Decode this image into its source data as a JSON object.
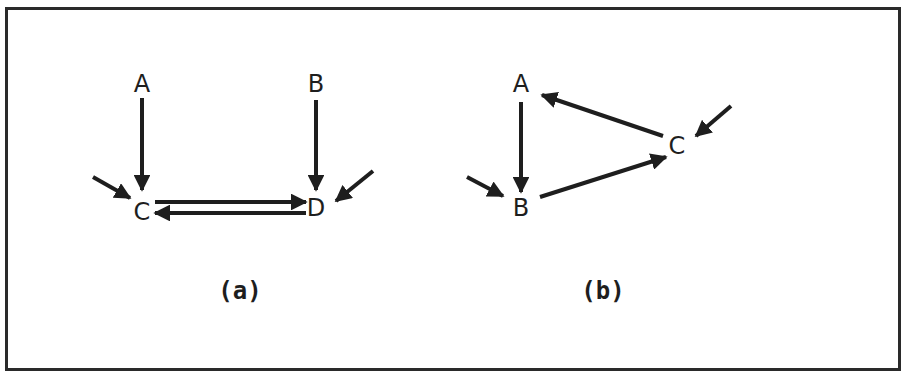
{
  "figures": [
    {
      "id": "a",
      "caption": "(a)",
      "caption_pos": [
        240,
        291
      ],
      "nodes": [
        {
          "id": "A",
          "label": "A",
          "x": 142,
          "y": 84
        },
        {
          "id": "B",
          "label": "B",
          "x": 316,
          "y": 84
        },
        {
          "id": "C",
          "label": "C",
          "x": 142,
          "y": 212
        },
        {
          "id": "D",
          "label": "D",
          "x": 316,
          "y": 208
        }
      ],
      "edges": [
        {
          "from": "A",
          "to": "C",
          "x1": 142,
          "y1": 98,
          "x2": 142,
          "y2": 190
        },
        {
          "from": "B",
          "to": "D",
          "x1": 316,
          "y1": 100,
          "x2": 316,
          "y2": 190
        },
        {
          "from": "C",
          "to": "D",
          "x1": 155,
          "y1": 202,
          "x2": 306,
          "y2": 202
        },
        {
          "from": "D",
          "to": "C",
          "x1": 306,
          "y1": 213,
          "x2": 155,
          "y2": 213
        }
      ],
      "external_inputs": [
        {
          "to": "C",
          "x1": 93,
          "y1": 177,
          "x2": 130,
          "y2": 198
        },
        {
          "to": "D",
          "x1": 373,
          "y1": 171,
          "x2": 336,
          "y2": 201
        }
      ]
    },
    {
      "id": "b",
      "caption": "(b)",
      "caption_pos": [
        603,
        291
      ],
      "nodes": [
        {
          "id": "A",
          "label": "A",
          "x": 521,
          "y": 84
        },
        {
          "id": "B",
          "label": "B",
          "x": 521,
          "y": 208
        },
        {
          "id": "C",
          "label": "C",
          "x": 677,
          "y": 146
        }
      ],
      "edges": [
        {
          "from": "A",
          "to": "B",
          "x1": 521,
          "y1": 102,
          "x2": 521,
          "y2": 192
        },
        {
          "from": "B",
          "to": "C",
          "x1": 540,
          "y1": 197,
          "x2": 666,
          "y2": 157
        },
        {
          "from": "C",
          "to": "A",
          "x1": 663,
          "y1": 136,
          "x2": 542,
          "y2": 95
        }
      ],
      "external_inputs": [
        {
          "to": "B",
          "x1": 467,
          "y1": 177,
          "x2": 503,
          "y2": 196
        },
        {
          "to": "C",
          "x1": 731,
          "y1": 106,
          "x2": 696,
          "y2": 136
        }
      ]
    }
  ],
  "colors": {
    "ink": "#1e1e1e",
    "frame": "#2a2a2a",
    "background": "#ffffff"
  }
}
